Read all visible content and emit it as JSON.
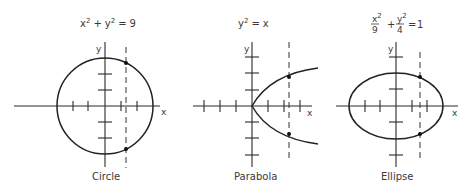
{
  "panels": [
    {
      "name": "circle",
      "equation": {
        "a": "x",
        "a_exp": "2",
        "op": "+",
        "b": "y",
        "b_exp": "2",
        "eq": "=",
        "rhs": "9"
      },
      "caption": "Circle",
      "axis_x_label": "x",
      "axis_y_label": "y"
    },
    {
      "name": "parabola",
      "equation": {
        "a": "y",
        "a_exp": "2",
        "eq": "=",
        "rhs": "x"
      },
      "caption": "Parabola",
      "axis_x_label": "x",
      "axis_y_label": "y"
    },
    {
      "name": "ellipse",
      "equation": {
        "num1": "x",
        "num1_exp": "2",
        "den1": "9",
        "op": "+",
        "num2": "y",
        "num2_exp": "2",
        "den2": "4",
        "eq": "=",
        "rhs": "1"
      },
      "caption": "Ellipse",
      "axis_x_label": "x",
      "axis_y_label": "y"
    }
  ]
}
